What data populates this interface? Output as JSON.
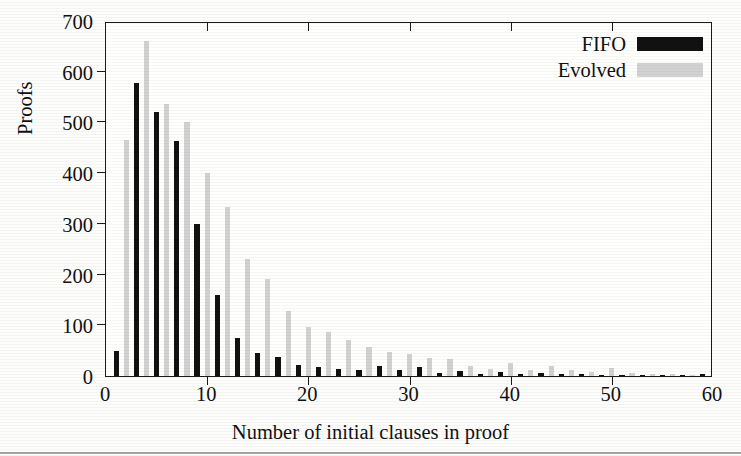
{
  "chart_data": {
    "type": "bar",
    "title": "",
    "xlabel": "Number of initial clauses in proof",
    "ylabel": "Proofs",
    "xlim": [
      0,
      60
    ],
    "ylim": [
      0,
      700
    ],
    "xticks": [
      0,
      10,
      20,
      30,
      40,
      50,
      60
    ],
    "yticks": [
      0,
      100,
      200,
      300,
      400,
      500,
      600,
      700
    ],
    "grid": false,
    "legend_position": "top-right",
    "series": [
      {
        "name": "FIFO",
        "color": "#111111",
        "x": [
          1,
          3,
          5,
          7,
          9,
          11,
          13,
          15,
          17,
          19,
          21,
          23,
          25,
          27,
          29,
          31,
          33,
          35,
          37,
          39,
          41,
          43,
          45,
          47,
          49,
          51,
          53,
          55,
          57,
          59
        ],
        "values": [
          50,
          578,
          521,
          464,
          299,
          159,
          75,
          45,
          38,
          22,
          17,
          13,
          11,
          20,
          11,
          18,
          6,
          9,
          4,
          7,
          3,
          6,
          3,
          3,
          2,
          2,
          2,
          1,
          1,
          4
        ]
      },
      {
        "name": "Evolved",
        "color": "#d2d2d2",
        "x": [
          2,
          4,
          6,
          8,
          10,
          12,
          14,
          16,
          18,
          20,
          22,
          24,
          26,
          28,
          30,
          32,
          34,
          36,
          38,
          40,
          42,
          44,
          46,
          48,
          50,
          52,
          54,
          56,
          58
        ],
        "values": [
          465,
          660,
          536,
          500,
          400,
          334,
          230,
          192,
          128,
          97,
          86,
          72,
          57,
          48,
          43,
          35,
          33,
          19,
          14,
          25,
          12,
          20,
          11,
          8,
          16,
          6,
          4,
          3,
          2
        ]
      }
    ]
  },
  "legend": {
    "items": [
      {
        "label": "FIFO",
        "color": "#111111"
      },
      {
        "label": "Evolved",
        "color": "#d2d2d2"
      }
    ]
  },
  "axes": {
    "y_title": "Proofs",
    "x_title": "Number of initial clauses in proof",
    "y_tick_labels": [
      "0",
      "100",
      "200",
      "300",
      "400",
      "500",
      "600",
      "700"
    ],
    "x_tick_labels": [
      "0",
      "10",
      "20",
      "30",
      "40",
      "50",
      "60"
    ]
  }
}
